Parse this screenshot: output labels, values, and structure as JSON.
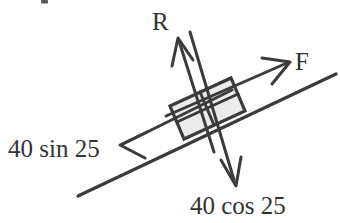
{
  "figure": {
    "background_color": "#ffffff",
    "line_color": "#3b3b3b",
    "text_color": "#333333",
    "block_fill_color": "#ebebeb"
  },
  "labels": {
    "normal_force": "R",
    "applied_force": "F",
    "weight_component_parallel": "40 sin 25",
    "weight_component_perpendicular": "40 cos 25"
  },
  "vectors": [
    {
      "name": "normal-force-vector",
      "label": "R",
      "direction": "up-left perpendicular to incline",
      "tail": [
        214,
        152
      ],
      "tip": [
        178,
        38
      ]
    },
    {
      "name": "applied-force-vector",
      "label": "F",
      "direction": "up the incline",
      "tail": [
        166,
        115
      ],
      "tip": [
        290,
        62
      ]
    },
    {
      "name": "parallel-weight-vector",
      "label": "40 sin 25",
      "direction": "down the incline",
      "tail": [
        232,
        88
      ],
      "tip": [
        120,
        145
      ]
    },
    {
      "name": "perpendicular-weight-vector",
      "label": "40 cos 25",
      "direction": "down-right perpendicular to incline",
      "tail": [
        190,
        32
      ],
      "tip": [
        236,
        185
      ]
    }
  ],
  "incline": {
    "name": "incline-surface",
    "start": [
      78,
      196
    ],
    "end": [
      336,
      74
    ],
    "angle_degrees": 25
  },
  "block": {
    "name": "block-on-incline",
    "fill": "#ebebeb",
    "corners": [
      [
        170,
        106
      ],
      [
        231,
        78
      ],
      [
        245,
        111
      ],
      [
        184,
        139
      ]
    ]
  },
  "label_positions": {
    "normal_force": {
      "x": 152,
      "y": 30
    },
    "applied_force": {
      "x": 295,
      "y": 70
    },
    "weight_component_parallel": {
      "x": 8,
      "y": 157
    },
    "weight_component_perpendicular": {
      "x": 190,
      "y": 214
    }
  },
  "artifact": {
    "name": "cropped-glyph-fragment",
    "x": 41,
    "y": 0,
    "width": 7,
    "height": 4
  }
}
